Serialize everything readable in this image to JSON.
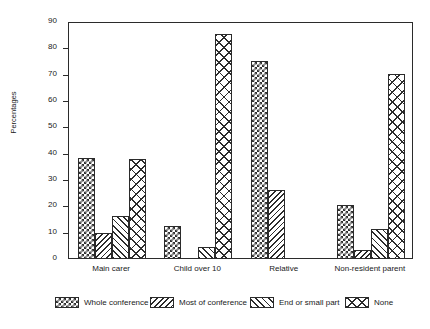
{
  "chart_data": {
    "type": "bar",
    "title": "",
    "subtitle": "",
    "xlabel": "",
    "ylabel": "Percentages",
    "ylim": [
      0,
      90
    ],
    "ytick_labels": [
      "0",
      "10",
      "20",
      "30",
      "40",
      "50",
      "60",
      "70",
      "80",
      "90"
    ],
    "ytick_values": [
      0,
      10,
      20,
      30,
      40,
      50,
      60,
      70,
      80,
      90
    ],
    "grid": false,
    "legend_position": "bottom",
    "categories": [
      "Main carer",
      "Child over 10",
      "Relative",
      "Non-resident parent"
    ],
    "series": [
      {
        "name": "Whole conference",
        "pattern": "checkerboard",
        "values": [
          38,
          12,
          75,
          20
        ]
      },
      {
        "name": "Most of conference",
        "pattern": "backslash-hatch",
        "values": [
          9.5,
          0,
          26,
          3
        ]
      },
      {
        "name": "End or small part",
        "pattern": "forwardslash-hatch",
        "values": [
          16,
          4,
          0,
          11
        ]
      },
      {
        "name": "None",
        "pattern": "crosshatch",
        "values": [
          37.5,
          85,
          0,
          70
        ]
      }
    ]
  },
  "legend": {
    "items": [
      {
        "label": "Whole conference"
      },
      {
        "label": "Most of conference"
      },
      {
        "label": "End or small part"
      },
      {
        "label": "None"
      }
    ]
  }
}
